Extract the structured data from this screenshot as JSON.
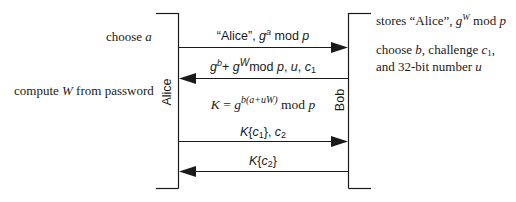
{
  "participants": {
    "alice": {
      "label": "Alice"
    },
    "bob": {
      "label": "Bob"
    }
  },
  "alice_notes": [
    {
      "id": "choose-a",
      "text_prefix": "choose ",
      "var": "a"
    },
    {
      "id": "compute-w",
      "text_prefix": "compute ",
      "var": "W",
      "text_suffix": " from password"
    }
  ],
  "bob_notes": [
    {
      "id": "stores",
      "text_prefix": "stores “Alice”, ",
      "base": "g",
      "exp": "W",
      "text_suffix": " mod ",
      "var": "p"
    },
    {
      "id": "choose-b",
      "line1_prefix": "choose ",
      "line1_var": "b",
      "line1_mid": ", challenge ",
      "line1_var2": "c",
      "line1_sub": "1",
      "line1_suffix": ",",
      "line2_prefix": "and 32-bit number ",
      "line2_var": "u"
    }
  ],
  "messages": [
    {
      "id": "msg1",
      "direction": "alice-to-bob",
      "text_a": "“Alice”, ",
      "base": "g",
      "exp": "a",
      "text_b": " mod ",
      "var": "p"
    },
    {
      "id": "msg2",
      "direction": "bob-to-alice",
      "b1": "g",
      "e1": "b",
      "plus": "+ ",
      "b2": "g",
      "e2": "W",
      "mid": "mod ",
      "p": "p",
      "rest": ", ",
      "u": "u",
      "comma": ", ",
      "c": "c",
      "csub": "1"
    },
    {
      "id": "key",
      "direction": "none",
      "K": "K",
      "eq": " = ",
      "g": "g",
      "exp": "b(a+uW)",
      "mod": " mod ",
      "p": "p"
    },
    {
      "id": "msg3",
      "direction": "alice-to-bob",
      "K": "K",
      "open": "{",
      "c": "c",
      "csub": "1",
      "close": "}, ",
      "c2": "c",
      "c2sub": "2"
    },
    {
      "id": "msg4",
      "direction": "bob-to-alice",
      "K": "K",
      "open": "{",
      "c": "c",
      "csub": "2",
      "close": "}"
    }
  ],
  "colors": {
    "line": "#1a1a1a",
    "text": "#1a1a1a",
    "background": "#ffffff"
  }
}
